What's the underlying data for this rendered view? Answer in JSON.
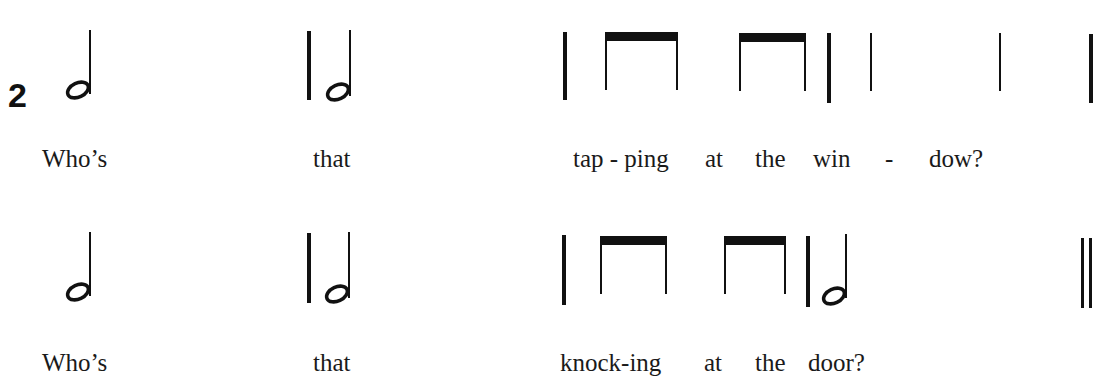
{
  "exercise": {
    "number": "2",
    "lines": [
      {
        "rhythm": [
          "half",
          "barline",
          "half",
          "barline",
          "eighth-eighth",
          "eighth-eighth",
          "barline",
          "quarter",
          "quarter",
          "barline"
        ],
        "lyrics": [
          "Who’s",
          "that",
          "tap - ping",
          "at",
          "the",
          "win",
          "-",
          "dow?"
        ]
      },
      {
        "rhythm": [
          "half",
          "barline",
          "half",
          "barline",
          "eighth-eighth",
          "eighth-eighth",
          "barline",
          "half",
          "final-double-barline"
        ],
        "lyrics": [
          "Who’s",
          "that",
          "knock-ing",
          "at",
          "the",
          "door?"
        ]
      }
    ]
  },
  "colors": {
    "ink": "#111111",
    "paper": "#ffffff"
  }
}
